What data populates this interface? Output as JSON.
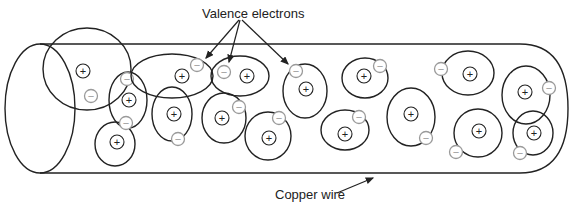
{
  "labels": {
    "valence_electrons": "Valence electrons",
    "copper_wire": "Copper wire"
  },
  "symbols": {
    "nucleus": "+",
    "electron": "−"
  },
  "colors": {
    "stroke": "#222222",
    "electron_stroke": "#9a9a9a",
    "background": "#ffffff"
  },
  "wire": {
    "left_x": 40,
    "right_x": 540,
    "top_y": 44,
    "bottom_y": 173
  },
  "atoms": [
    {
      "cx": 87,
      "cy": 69,
      "rx": 44,
      "ry": 41,
      "nx": 83,
      "ny": 71,
      "ex": 91,
      "ey": 96
    },
    {
      "cx": 128,
      "cy": 100,
      "rx": 19,
      "ry": 28,
      "nx": 129,
      "ny": 100,
      "ex": 127,
      "ey": 79
    },
    {
      "cx": 115,
      "cy": 144,
      "rx": 20,
      "ry": 22,
      "nx": 117,
      "ny": 142,
      "ex": 126,
      "ey": 123
    },
    {
      "cx": 172,
      "cy": 76,
      "rx": 41,
      "ry": 22,
      "nx": 182,
      "ny": 76,
      "ex": 197,
      "ey": 65
    },
    {
      "cx": 172,
      "cy": 114,
      "rx": 20,
      "ry": 27,
      "nx": 174,
      "ny": 114,
      "ex": 178,
      "ey": 139
    },
    {
      "cx": 240,
      "cy": 76,
      "rx": 29,
      "ry": 20,
      "nx": 247,
      "ny": 76,
      "ex": 224,
      "ey": 72
    },
    {
      "cx": 224,
      "cy": 118,
      "rx": 22,
      "ry": 25,
      "nx": 222,
      "ny": 118,
      "ex": 239,
      "ey": 107
    },
    {
      "cx": 305,
      "cy": 91,
      "rx": 22,
      "ry": 27,
      "nx": 306,
      "ny": 89,
      "ex": 296,
      "ey": 71
    },
    {
      "cx": 268,
      "cy": 136,
      "rx": 23,
      "ry": 24,
      "nx": 269,
      "ny": 138,
      "ex": 279,
      "ey": 118
    },
    {
      "cx": 365,
      "cy": 78,
      "rx": 23,
      "ry": 20,
      "nx": 364,
      "ny": 76,
      "ex": 380,
      "ey": 66
    },
    {
      "cx": 345,
      "cy": 130,
      "rx": 24,
      "ry": 20,
      "nx": 345,
      "ny": 134,
      "ex": 359,
      "ey": 117
    },
    {
      "cx": 411,
      "cy": 117,
      "rx": 24,
      "ry": 29,
      "nx": 411,
      "ny": 114,
      "ex": 426,
      "ey": 138
    },
    {
      "cx": 468,
      "cy": 73,
      "rx": 26,
      "ry": 22,
      "nx": 470,
      "ny": 74,
      "ex": 441,
      "ey": 69
    },
    {
      "cx": 478,
      "cy": 133,
      "rx": 24,
      "ry": 24,
      "nx": 479,
      "ny": 131,
      "ex": 456,
      "ey": 152
    },
    {
      "cx": 526,
      "cy": 95,
      "rx": 24,
      "ry": 29,
      "nx": 525,
      "ny": 92,
      "ex": 549,
      "ey": 88
    },
    {
      "cx": 533,
      "cy": 133,
      "rx": 20,
      "ry": 22,
      "nx": 534,
      "ny": 133,
      "ex": 520,
      "ey": 153
    }
  ],
  "arrows": {
    "valence": [
      {
        "x1": 239,
        "y1": 20,
        "x2": 206,
        "y2": 58
      },
      {
        "x1": 240,
        "y1": 20,
        "x2": 229,
        "y2": 62
      },
      {
        "x1": 242,
        "y1": 20,
        "x2": 288,
        "y2": 64
      }
    ],
    "copper": {
      "x1": 337,
      "y1": 193,
      "x2": 373,
      "y2": 178
    }
  }
}
